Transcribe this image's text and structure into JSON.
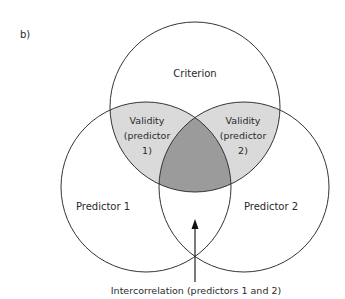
{
  "panel_label": "b)",
  "diagram": {
    "type": "venn",
    "circles": [
      {
        "id": "criterion",
        "label": "Criterion"
      },
      {
        "id": "predictor1",
        "label": "Predictor 1"
      },
      {
        "id": "predictor2",
        "label": "Predictor 2"
      }
    ],
    "regions": {
      "validity1": {
        "line1": "Validity",
        "line2": "(predictor",
        "line3": "1)"
      },
      "validity2": {
        "line1": "Validity",
        "line2": "(predictor",
        "line3": "2)"
      }
    },
    "annotation": "Intercorrelation (predictors 1 and 2)",
    "colors": {
      "validity_fill": "#dadada",
      "overlap_fill": "#9b9b9b",
      "stroke": "#333333"
    }
  }
}
